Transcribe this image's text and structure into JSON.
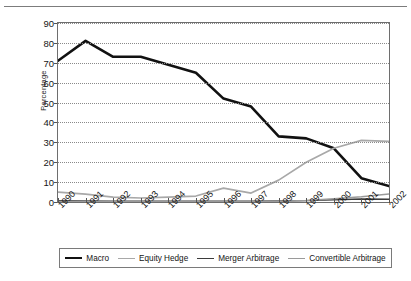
{
  "figure": {
    "top_rule": true,
    "y_axis_title": "Percentage"
  },
  "chart_data": {
    "type": "line",
    "title": "",
    "xlabel": "",
    "ylabel": "Percentage",
    "categories": [
      "1990",
      "1991",
      "1992",
      "1993",
      "1994",
      "1995",
      "1996",
      "1997",
      "1998",
      "1999",
      "2000",
      "2001",
      "2002"
    ],
    "yticks": [
      0,
      10,
      20,
      30,
      40,
      50,
      60,
      70,
      80,
      90
    ],
    "ylim": [
      0,
      90
    ],
    "grid": true,
    "grid_style": "dotted-horizontal",
    "legend_position": "bottom",
    "series": [
      {
        "name": "Macro",
        "color": "#111111",
        "width": 2.6,
        "values": [
          71,
          81,
          73,
          73,
          69,
          65,
          52,
          48,
          33,
          32,
          27,
          12,
          8
        ]
      },
      {
        "name": "Equity Hedge",
        "color": "#a8a8a8",
        "width": 1.7,
        "values": [
          5,
          4,
          2.5,
          2,
          2.5,
          3,
          7,
          4.5,
          11,
          20,
          27,
          31,
          30.5
        ]
      },
      {
        "name": "Merger Arbitrage",
        "color": "#3b3b3b",
        "width": 1.4,
        "values": [
          0.6,
          0.5,
          0.4,
          0.4,
          0.4,
          0.4,
          0.4,
          0.4,
          0.5,
          0.7,
          1.1,
          1.5,
          1.4
        ]
      },
      {
        "name": "Convertible Arbitrage",
        "color": "#9a9a9a",
        "width": 1.5,
        "values": [
          0.3,
          0.3,
          0.3,
          0.3,
          0.3,
          0.3,
          0.3,
          0.3,
          0.4,
          0.8,
          1.6,
          2.6,
          4
        ]
      }
    ]
  },
  "legend": {
    "items": [
      {
        "label": "Macro"
      },
      {
        "label": "Equity Hedge"
      },
      {
        "label": "Merger Arbitrage"
      },
      {
        "label": "Convertible Arbitrage"
      }
    ]
  }
}
